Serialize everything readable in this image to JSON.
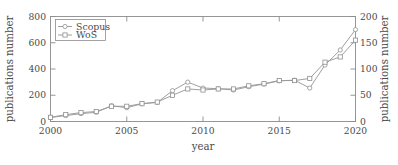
{
  "chart_data": {
    "type": "line",
    "title": "",
    "subtitle": "",
    "xlabel": "year",
    "ylabel": "publications number",
    "y2label": "publications number",
    "xlim": [
      2000,
      2020
    ],
    "ylim": [
      0,
      800
    ],
    "y2lim": [
      0,
      200
    ],
    "grid": false,
    "legend_position": "top-left",
    "xticks": [
      "2000",
      "2005",
      "2010",
      "2015",
      "2020"
    ],
    "xtick_values": [
      2000,
      2005,
      2010,
      2015,
      2020
    ],
    "yticks": [
      "0",
      "200",
      "400",
      "600",
      "800"
    ],
    "ytick_values": [
      0,
      200,
      400,
      600,
      800
    ],
    "y2ticks": [
      "0",
      "50",
      "100",
      "150",
      "200"
    ],
    "y2tick_values": [
      0,
      50,
      100,
      150,
      200
    ],
    "x": [
      2000,
      2001,
      2002,
      2003,
      2004,
      2005,
      2006,
      2007,
      2008,
      2009,
      2010,
      2011,
      2012,
      2013,
      2014,
      2015,
      2016,
      2017,
      2018,
      2019,
      2020
    ],
    "series": [
      {
        "name": "Scopus",
        "axis": "left",
        "marker": "circle",
        "color": "#9a9a9a",
        "values": [
          30,
          45,
          60,
          70,
          120,
          105,
          135,
          145,
          235,
          300,
          255,
          250,
          240,
          265,
          285,
          310,
          315,
          255,
          430,
          545,
          700
        ]
      },
      {
        "name": "WoS",
        "axis": "right",
        "marker": "square",
        "color": "#9a9a9a",
        "values": [
          8,
          13,
          17,
          19,
          29,
          29,
          34,
          37,
          50,
          62,
          60,
          62,
          62,
          68,
          72,
          78,
          78,
          82,
          113,
          123,
          155
        ]
      }
    ],
    "legend": [
      "Scopus",
      "WoS"
    ],
    "annotations": []
  },
  "legend": {
    "items": [
      {
        "label": "Scopus",
        "marker": "circle-marker"
      },
      {
        "label": "WoS",
        "marker": "square-marker"
      }
    ]
  },
  "axes": {
    "left_title": "publications number",
    "right_title": "publications number",
    "bottom_title": "year"
  },
  "colors": {
    "line": "#9a9a9a",
    "frame": "#8c8c8c",
    "text": "#4a4a4a",
    "marker_fill": "#ffffff",
    "background": "#ffffff"
  }
}
